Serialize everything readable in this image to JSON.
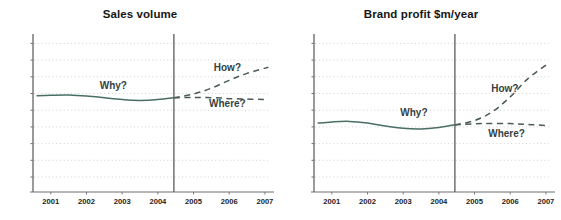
{
  "figure": {
    "background": "#ffffff",
    "grid_color": "#cfcfcf",
    "axis_color": "#6f6f6f",
    "history_color": "#4a6d66",
    "forecast_color": "#4a5a57",
    "annotation_color": "#35413f",
    "divider_color": "#5a5a5a"
  },
  "panels": [
    {
      "id": "sales-volume",
      "title": "Sales volume",
      "annotations": [
        {
          "key": "why",
          "label": "Why?"
        },
        {
          "key": "how",
          "label": "How?"
        },
        {
          "key": "where",
          "label": "Where?"
        }
      ]
    },
    {
      "id": "brand-profit",
      "title": "Brand profit $m/year",
      "annotations": [
        {
          "key": "why",
          "label": "Why?"
        },
        {
          "key": "how",
          "label": "How?"
        },
        {
          "key": "where",
          "label": "Where?"
        }
      ]
    }
  ],
  "chart_data": [
    {
      "type": "line",
      "title": "Sales volume",
      "xlabel": "",
      "ylabel": "",
      "grid": true,
      "legend": "none",
      "xlim": [
        2000.5,
        2007.2
      ],
      "ylim": [
        0,
        9
      ],
      "xticks": [
        "2001",
        "2002",
        "2003",
        "2004",
        "2005",
        "2006",
        "2007"
      ],
      "yticks": [],
      "gridlines": 9,
      "divider": {
        "x": 2004.45,
        "label": ""
      },
      "series": [
        {
          "name": "history",
          "style": "solid",
          "x": [
            2000.6,
            2001.0,
            2001.5,
            2002.0,
            2002.5,
            2003.0,
            2003.5,
            2004.0,
            2004.45
          ],
          "values": [
            5.52,
            5.55,
            5.56,
            5.5,
            5.4,
            5.3,
            5.25,
            5.3,
            5.4
          ]
        },
        {
          "name": "How?",
          "style": "dashed",
          "x": [
            2004.45,
            2005.0,
            2005.5,
            2006.0,
            2006.5,
            2007.1
          ],
          "values": [
            5.4,
            5.62,
            5.95,
            6.4,
            6.8,
            7.15
          ]
        },
        {
          "name": "Where?",
          "style": "dashed",
          "x": [
            2004.45,
            2005.0,
            2005.6,
            2006.2,
            2007.1
          ],
          "values": [
            5.4,
            5.42,
            5.4,
            5.34,
            5.3
          ]
        }
      ],
      "annotations": [
        {
          "text": "Why?",
          "x": 2002.75,
          "y": 5.92
        },
        {
          "text": "How?",
          "x": 2005.95,
          "y": 6.92
        },
        {
          "text": "Where?",
          "x": 2005.95,
          "y": 4.9
        }
      ]
    },
    {
      "type": "line",
      "title": "Brand profit $m/year",
      "xlabel": "",
      "ylabel": "",
      "grid": true,
      "legend": "none",
      "xlim": [
        2000.5,
        2007.2
      ],
      "ylim": [
        0,
        9
      ],
      "xticks": [
        "2001",
        "2002",
        "2003",
        "2004",
        "2005",
        "2006",
        "2007"
      ],
      "yticks": [],
      "gridlines": 9,
      "divider": {
        "x": 2004.45,
        "label": ""
      },
      "series": [
        {
          "name": "history",
          "style": "solid",
          "x": [
            2000.6,
            2001.0,
            2001.5,
            2002.0,
            2002.5,
            2003.0,
            2003.5,
            2004.0,
            2004.45
          ],
          "values": [
            3.95,
            4.02,
            4.05,
            3.95,
            3.78,
            3.65,
            3.62,
            3.7,
            3.85
          ]
        },
        {
          "name": "How?",
          "style": "dashed",
          "x": [
            2004.45,
            2005.0,
            2005.5,
            2006.0,
            2006.5,
            2007.05
          ],
          "values": [
            3.85,
            4.1,
            4.6,
            5.45,
            6.5,
            7.35
          ]
        },
        {
          "name": "Where?",
          "style": "dashed",
          "x": [
            2004.45,
            2005.2,
            2006.0,
            2006.6,
            2007.1
          ],
          "values": [
            3.85,
            3.92,
            3.92,
            3.86,
            3.8
          ]
        }
      ],
      "annotations": [
        {
          "text": "Why?",
          "x": 2003.3,
          "y": 4.35
        },
        {
          "text": "How?",
          "x": 2005.85,
          "y": 5.72
        },
        {
          "text": "Where?",
          "x": 2005.9,
          "y": 3.18
        }
      ]
    }
  ]
}
